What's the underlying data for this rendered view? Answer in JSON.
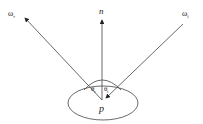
{
  "diagram": {
    "labels": {
      "normal": "n",
      "reflected": "ω",
      "reflected_sub": "r",
      "incident": "ω",
      "incident_sub": "i",
      "theta_r": "θ",
      "theta_r_sub": "r",
      "theta_i": "θ",
      "theta_i_sub": "i",
      "point": "p"
    },
    "colors": {
      "stroke": "#333333",
      "text": "#222222"
    }
  }
}
